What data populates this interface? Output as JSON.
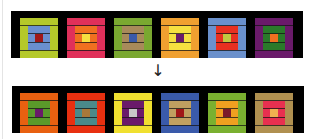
{
  "puzzle": {
    "arrow_glyph": "↓",
    "strip_background": "#000000",
    "input_row": [
      {
        "outer": "#b5c92a",
        "middle": "#6a8fcf",
        "center": "#a01818"
      },
      {
        "outer": "#e0305a",
        "middle": "#f07020",
        "center": "#f5e040"
      },
      {
        "outer": "#7aa830",
        "middle": "#a88a5a",
        "center": "#3a5aaa"
      },
      {
        "outer": "#f0a030",
        "middle": "#f5e040",
        "center": "#6a1a6a"
      },
      {
        "outer": "#6a90cc",
        "middle": "#e83020",
        "center": "#c0c840"
      },
      {
        "outer": "#6a1a6a",
        "middle": "#2a7a2a",
        "center": "#f07020"
      }
    ],
    "output_row": [
      {
        "outer": "#e86010",
        "middle": "#5a9a2a",
        "center": "#6a1a6a"
      },
      {
        "outer": "#e83010",
        "middle": "#4a8a8a",
        "center": "#a8783a"
      },
      {
        "outer": "#f0e030",
        "middle": "#6a1a6a",
        "center": "#c8c8c8"
      },
      {
        "outer": "#3a5aaa",
        "middle": "#c0a060",
        "center": "#a01818"
      },
      {
        "outer": "#7ab030",
        "middle": "#f0a020",
        "center": "#7a1a2a"
      },
      {
        "outer": "#b09050",
        "middle": "#e83050",
        "center": "#f0b050"
      }
    ]
  }
}
